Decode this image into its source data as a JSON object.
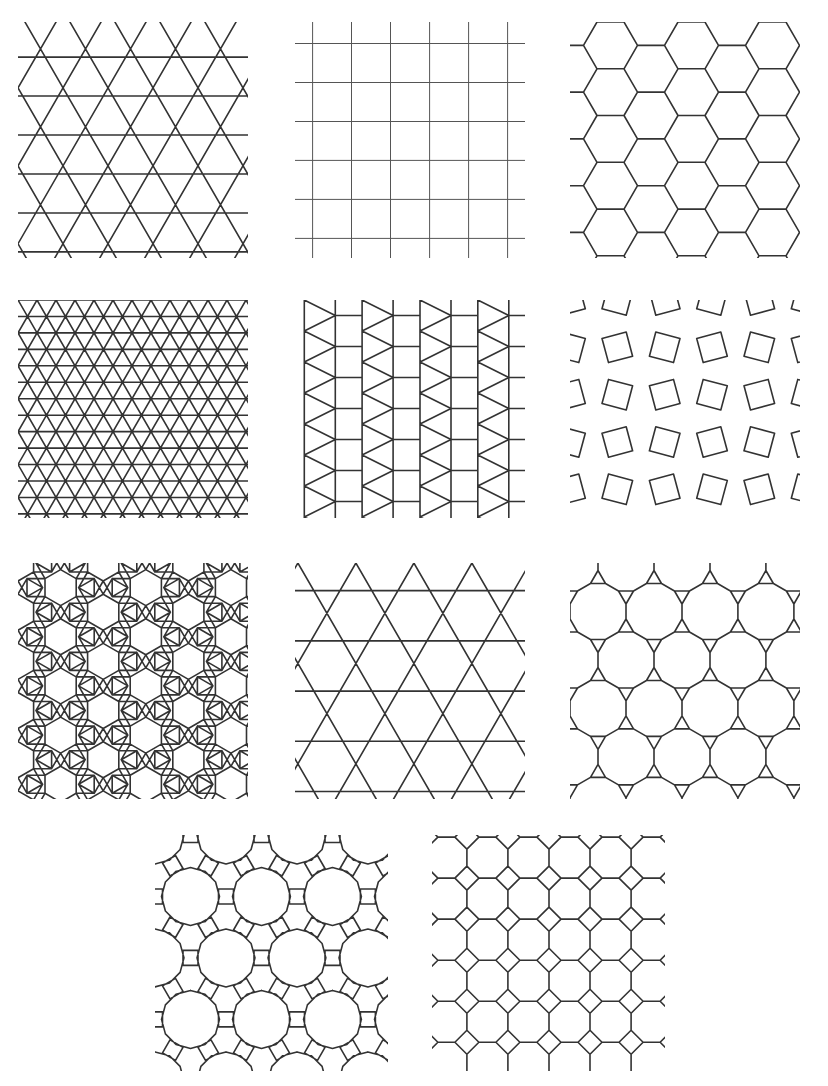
{
  "figure": {
    "background": "#ffffff",
    "line_color": "#333333",
    "panels": [
      {
        "id": "triangular",
        "tiling": "3.3.3.3.3.3",
        "x": 18,
        "y": 22,
        "w": 230,
        "h": 236,
        "edge": 45
      },
      {
        "id": "square",
        "tiling": "4.4.4.4",
        "x": 295,
        "y": 22,
        "w": 230,
        "h": 236,
        "edge": 39
      },
      {
        "id": "hexagonal",
        "tiling": "6.6.6",
        "x": 570,
        "y": 22,
        "w": 230,
        "h": 236,
        "edge": 27
      },
      {
        "id": "snub-hexagonal",
        "tiling": "3.3.3.3.6",
        "x": 18,
        "y": 300,
        "w": 230,
        "h": 218,
        "edge": 19
      },
      {
        "id": "elongated-triangular",
        "tiling": "3.3.3.4.4",
        "x": 295,
        "y": 300,
        "w": 230,
        "h": 218,
        "edge": 31
      },
      {
        "id": "snub-square",
        "tiling": "3.3.4.3.4",
        "x": 570,
        "y": 300,
        "w": 230,
        "h": 218,
        "edge": 25
      },
      {
        "id": "rhombitrihexagonal",
        "tiling": "3.4.6.4",
        "x": 18,
        "y": 563,
        "w": 230,
        "h": 236,
        "edge": 18
      },
      {
        "id": "trihexagonal",
        "tiling": "3.6.3.6",
        "x": 295,
        "y": 563,
        "w": 230,
        "h": 236,
        "edge": 58
      },
      {
        "id": "truncated-hexagonal",
        "tiling": "3.12.12",
        "x": 570,
        "y": 563,
        "w": 230,
        "h": 236,
        "edge": 15
      },
      {
        "id": "truncated-trihexagonal",
        "tiling": "4.6.12",
        "x": 155,
        "y": 835,
        "w": 233,
        "h": 236,
        "edge": 15
      },
      {
        "id": "truncated-square",
        "tiling": "4.8.8",
        "x": 432,
        "y": 835,
        "w": 233,
        "h": 236,
        "edge": 17
      }
    ]
  }
}
